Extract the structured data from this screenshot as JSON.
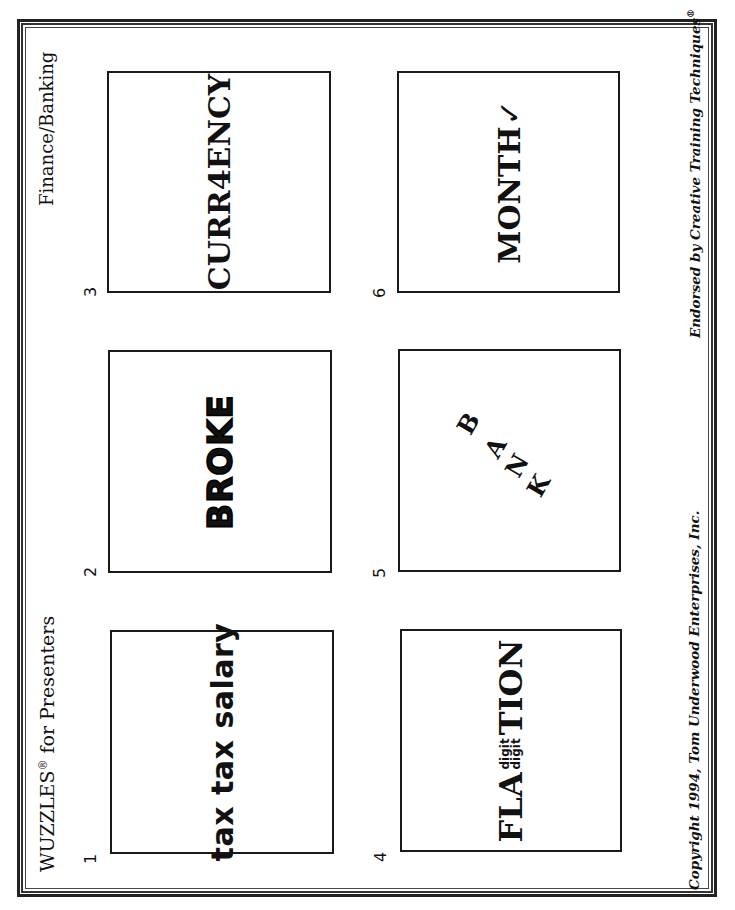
{
  "header": {
    "title": "WUZZLES",
    "title_mark": "®",
    "title_suffix": " for Presenters",
    "topic": "Finance/Banking"
  },
  "footer": {
    "copyright": "Copyright 1994, Tom Underwood Enterprises, Inc.",
    "endorsement": "Endorsed by Creative Training Techniques",
    "endorsement_mark": "®"
  },
  "puzzles": [
    {
      "number": "1",
      "text": "tax tax salary"
    },
    {
      "number": "2",
      "text": "BROKE"
    },
    {
      "number": "3",
      "text": "CURR4ENCY"
    },
    {
      "number": "4",
      "prefix": "FLA",
      "stack_top": "digit",
      "stack_bottom": "digit",
      "suffix": "TION"
    },
    {
      "number": "5",
      "letters": [
        "B",
        "A",
        "N",
        "K"
      ]
    },
    {
      "number": "6",
      "text": "MONTH",
      "mark": "✓"
    }
  ],
  "colors": {
    "ink": "#111111",
    "paper": "#ffffff"
  }
}
